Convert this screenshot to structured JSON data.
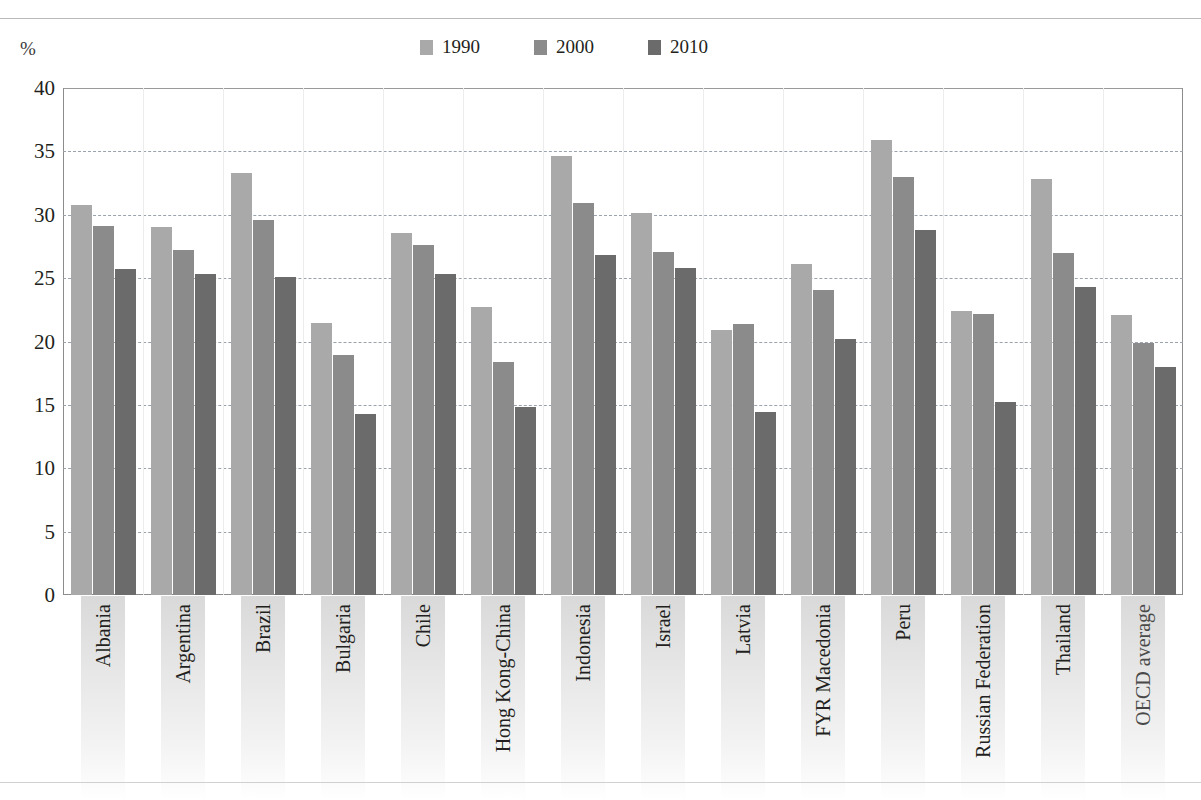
{
  "page": {
    "top_caption": "",
    "percent_symbol": "%"
  },
  "legend": {
    "items": [
      {
        "label": "1990",
        "color": "#a9a9a9",
        "icon": "legend-swatch-icon"
      },
      {
        "label": "2000",
        "color": "#8b8b8b",
        "icon": "legend-swatch-icon"
      },
      {
        "label": "2010",
        "color": "#6b6b6b",
        "icon": "legend-swatch-icon"
      }
    ]
  },
  "axis": {
    "y_ticks": [
      "40",
      "35",
      "30",
      "25",
      "20",
      "15",
      "10",
      "5",
      "0"
    ]
  },
  "chart_data": {
    "type": "bar",
    "title": "",
    "xlabel": "",
    "ylabel": "%",
    "ylim": [
      0,
      40
    ],
    "y_tick_step": 5,
    "grid": "horizontal-dashed",
    "legend_position": "top-center",
    "categories": [
      "Albania",
      "Argentina",
      "Brazil",
      "Bulgaria",
      "Chile",
      "Hong Kong-China",
      "Indonesia",
      "Israel",
      "Latvia",
      "FYR Macedonia",
      "Peru",
      "Russian Federation",
      "Thailand",
      "OECD average"
    ],
    "series": [
      {
        "name": "1990",
        "color": "#a9a9a9",
        "values": [
          30.8,
          29.0,
          33.3,
          21.5,
          28.6,
          22.7,
          34.6,
          30.1,
          20.9,
          26.1,
          35.9,
          22.4,
          32.8,
          22.1
        ]
      },
      {
        "name": "2000",
        "color": "#8b8b8b",
        "values": [
          29.1,
          27.2,
          29.6,
          18.9,
          27.6,
          18.4,
          30.9,
          27.1,
          21.4,
          24.1,
          33.0,
          22.2,
          27.0,
          19.9
        ]
      },
      {
        "name": "2010",
        "color": "#6b6b6b",
        "values": [
          25.7,
          25.3,
          25.1,
          14.3,
          25.3,
          14.8,
          26.8,
          25.8,
          14.4,
          20.2,
          28.8,
          15.2,
          24.3,
          18.0
        ]
      }
    ]
  }
}
